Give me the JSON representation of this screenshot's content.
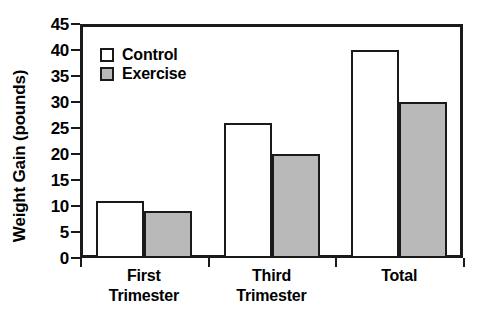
{
  "chart_data": {
    "type": "bar",
    "title": "",
    "xlabel": "",
    "ylabel": "Weight Gain (pounds)",
    "categories": [
      "First Trimester",
      "Third Trimester",
      "Total"
    ],
    "category_lines": [
      [
        "First",
        "Trimester"
      ],
      [
        "Third",
        "Trimester"
      ],
      [
        "Total"
      ]
    ],
    "series": [
      {
        "name": "Control",
        "values": [
          11,
          26,
          40
        ],
        "color": "#ffffff"
      },
      {
        "name": "Exercise",
        "values": [
          9,
          20,
          30
        ],
        "color": "#b9b9b9"
      }
    ],
    "ylim": [
      0,
      45
    ],
    "ytick_step": 5,
    "yticks": [
      0,
      5,
      10,
      15,
      20,
      25,
      30,
      35,
      40,
      45
    ],
    "ytick_labels": [
      "0",
      "5",
      "10",
      "15",
      "20",
      "25",
      "30",
      "35",
      "40",
      "45"
    ],
    "grid": false,
    "legend_position": "upper left",
    "frame": "box",
    "bar_edge_color": "#1a1a1a"
  },
  "legend": {
    "entries": [
      {
        "label": "Control"
      },
      {
        "label": "Exercise"
      }
    ]
  }
}
